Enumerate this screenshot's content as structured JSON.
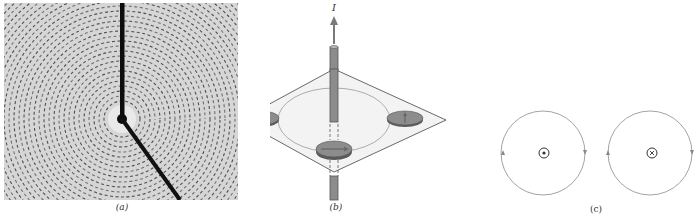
{
  "figure": {
    "panels": [
      {
        "id": "a",
        "caption": "(a)",
        "description": "Iron filings arranged in concentric circles around a vertical current-carrying wire",
        "colors": {
          "background": "#d9d9d9",
          "filings": "#2a2a2a",
          "wire": "#0d0d0d"
        }
      },
      {
        "id": "b",
        "caption": "(b)",
        "current_label": "I",
        "description": "Vertical wire passing through a horizontal plane with three compass needles aligned tangentially to a circle",
        "colors": {
          "wire": "#8a8a8a",
          "plane": "#f2f2f2",
          "compass": "#8c8c8c",
          "arrow": "#6e6e6e"
        }
      },
      {
        "id": "c",
        "caption": "(c)",
        "left_symbol": "dot",
        "right_symbol": "cross",
        "description": "Circular field lines: current out of page (counterclockwise) and into page (clockwise)",
        "colors": {
          "line": "#8a8a8a",
          "symbol": "#333333"
        }
      }
    ]
  }
}
